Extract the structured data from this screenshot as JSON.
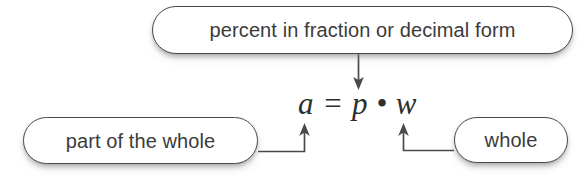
{
  "diagram": {
    "equation": {
      "text": "a = p • w",
      "parts": {
        "a": "a",
        "equals": "=",
        "p": "p",
        "dot": "•",
        "w": "w"
      }
    },
    "callouts": [
      {
        "id": "percent",
        "label": "percent in fraction or decimal form",
        "points_to": "p",
        "arrow": "down-arrow-icon"
      },
      {
        "id": "part",
        "label": "part of the whole",
        "points_to": "a",
        "arrow": "up-arrow-icon"
      },
      {
        "id": "whole",
        "label": "whole",
        "points_to": "w",
        "arrow": "up-arrow-icon"
      }
    ],
    "colors": {
      "background": "#ffffff",
      "box_border": "#4a4a4a",
      "box_fill": "#ffffff",
      "text": "#3b3b3b",
      "equation_text": "#2e2e2e",
      "connector": "#4a4a4a"
    }
  }
}
